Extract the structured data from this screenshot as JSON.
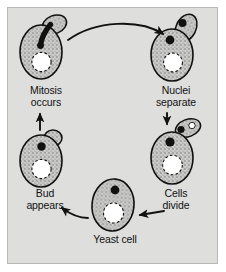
{
  "figure": {
    "background_color": "#dededd",
    "frame_color": "#b9b9b8",
    "page_color": "#ffffff",
    "ink_color": "#111111",
    "cytoplasm_color": "#c9c9c7",
    "nucleus_color": "#111111",
    "vacuole_color": "#ffffff"
  },
  "stages": [
    {
      "id": "mitosis",
      "label": "Mitosis\noccurs",
      "position": "top-left",
      "nucleus_state": "elongated spindle stretching into bud",
      "has_bud": true,
      "has_vacuole": true
    },
    {
      "id": "nuclei-separate",
      "label": "Nuclei\nseparate",
      "position": "top-right",
      "nucleus_state": "two separate round nuclei",
      "has_bud": true,
      "has_vacuole": true
    },
    {
      "id": "cells-divide",
      "label": "Cells\ndivide",
      "position": "right",
      "nucleus_state": "one nucleus per cell, bud detaching",
      "has_bud": true,
      "has_vacuole": true
    },
    {
      "id": "yeast-cell",
      "label": "Yeast cell",
      "position": "bottom",
      "nucleus_state": "single round nucleus",
      "has_bud": false,
      "has_vacuole": true
    },
    {
      "id": "bud-appears",
      "label": "Bud\nappears",
      "position": "left",
      "nucleus_state": "single round nucleus",
      "has_bud": true,
      "has_vacuole": true
    }
  ],
  "arrows": [
    {
      "id": "mitosis-to-nuclei",
      "from": "mitosis",
      "to": "nuclei-separate",
      "style": "curved",
      "direction": "right"
    },
    {
      "id": "nuclei-to-divide",
      "from": "nuclei-separate",
      "to": "cells-divide",
      "style": "straight",
      "direction": "down"
    },
    {
      "id": "divide-to-yeast",
      "from": "cells-divide",
      "to": "yeast-cell",
      "style": "straight",
      "direction": "left"
    },
    {
      "id": "yeast-to-bud",
      "from": "yeast-cell",
      "to": "bud-appears",
      "style": "straight",
      "direction": "left"
    },
    {
      "id": "bud-to-mitosis",
      "from": "bud-appears",
      "to": "mitosis",
      "style": "straight",
      "direction": "up"
    }
  ]
}
